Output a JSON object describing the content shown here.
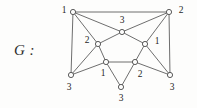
{
  "figure": {
    "caption": "G :",
    "style": {
      "background": "#fdfdfc",
      "edge_color": "#5d5d5d",
      "vertex_fill": "#fdfdfc",
      "vertex_stroke": "#4a4a4a",
      "label_color": "#1f1f1f"
    }
  },
  "chart_data": {
    "type": "diagram",
    "title": "G :",
    "nodes": [
      {
        "id": "top-left",
        "label": "1",
        "x": 73,
        "y": 12,
        "label_x": 64,
        "label_y": 11
      },
      {
        "id": "top-right",
        "label": "2",
        "x": 169,
        "y": 12,
        "label_x": 181,
        "label_y": 11
      },
      {
        "id": "top-center",
        "label": "3",
        "x": 122,
        "y": 32,
        "label_x": 122,
        "label_y": 21
      },
      {
        "id": "mid-left",
        "label": "2",
        "x": 98,
        "y": 44,
        "label_x": 87,
        "label_y": 41
      },
      {
        "id": "mid-right",
        "label": "1",
        "x": 145,
        "y": 44,
        "label_x": 157,
        "label_y": 42
      },
      {
        "id": "inner-bottom-left",
        "label": "1",
        "x": 106,
        "y": 62,
        "label_x": 103,
        "label_y": 74
      },
      {
        "id": "inner-bottom-right",
        "label": "2",
        "x": 135,
        "y": 62,
        "label_x": 140,
        "label_y": 75
      },
      {
        "id": "outer-bottom-left",
        "label": "3",
        "x": 71,
        "y": 75,
        "label_x": 69,
        "label_y": 88
      },
      {
        "id": "outer-bottom-right",
        "label": "3",
        "x": 170,
        "y": 75,
        "label_x": 172,
        "label_y": 88
      },
      {
        "id": "bottom-center",
        "label": "3",
        "x": 121,
        "y": 87,
        "label_x": 121,
        "label_y": 99
      }
    ],
    "edges": [
      [
        "top-left",
        "top-right"
      ],
      [
        "top-left",
        "top-center"
      ],
      [
        "top-left",
        "mid-left"
      ],
      [
        "top-left",
        "outer-bottom-left"
      ],
      [
        "top-right",
        "top-center"
      ],
      [
        "top-right",
        "mid-right"
      ],
      [
        "top-right",
        "outer-bottom-right"
      ],
      [
        "top-center",
        "mid-left"
      ],
      [
        "top-center",
        "mid-right"
      ],
      [
        "mid-left",
        "inner-bottom-left"
      ],
      [
        "mid-left",
        "outer-bottom-left"
      ],
      [
        "mid-right",
        "inner-bottom-right"
      ],
      [
        "mid-right",
        "outer-bottom-right"
      ],
      [
        "inner-bottom-left",
        "inner-bottom-right"
      ],
      [
        "inner-bottom-left",
        "bottom-center"
      ],
      [
        "inner-bottom-right",
        "bottom-center"
      ],
      [
        "outer-bottom-left",
        "inner-bottom-left"
      ],
      [
        "outer-bottom-right",
        "inner-bottom-right"
      ]
    ],
    "node_radius": 2.6,
    "labels": [
      "1",
      "2",
      "3",
      "2",
      "1",
      "1",
      "2",
      "3",
      "3",
      "3"
    ],
    "xlabel": "",
    "ylabel": ""
  }
}
